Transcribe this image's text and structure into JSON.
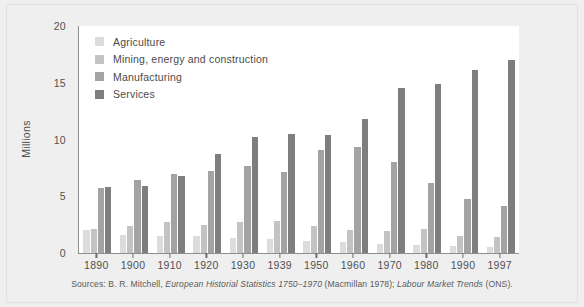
{
  "chart_data": {
    "type": "bar",
    "title": "",
    "subtitle": "",
    "xlabel": "",
    "ylabel": "Millions",
    "ylim": [
      0,
      20
    ],
    "yticks": [
      0,
      5,
      10,
      15,
      20
    ],
    "ytick_labels": [
      "0",
      "5",
      "10",
      "15",
      "20"
    ],
    "grid": false,
    "legend_position": "top-left-inside",
    "categories": [
      "1890",
      "1900",
      "1910",
      "1920",
      "1930",
      "1939",
      "1950",
      "1960",
      "1970",
      "1980",
      "1990",
      "1997"
    ],
    "series": [
      {
        "name": "Agriculture",
        "color": "#dcdcdc",
        "values": [
          2.0,
          1.6,
          1.5,
          1.5,
          1.3,
          1.2,
          1.1,
          1.0,
          0.8,
          0.7,
          0.6,
          0.5
        ]
      },
      {
        "name": "Mining, energy and construction",
        "color": "#c3c3c3",
        "values": [
          2.1,
          2.4,
          2.7,
          2.5,
          2.7,
          2.8,
          2.4,
          2.0,
          1.9,
          2.1,
          1.5,
          1.4
        ]
      },
      {
        "name": "Manufacturing",
        "color": "#a3a3a3",
        "values": [
          5.7,
          6.4,
          7.0,
          7.2,
          7.7,
          7.1,
          9.1,
          9.3,
          8.0,
          6.2,
          4.8,
          4.1
        ]
      },
      {
        "name": "Services",
        "color": "#7e7e7e",
        "values": [
          5.8,
          5.9,
          6.8,
          8.7,
          10.2,
          10.5,
          10.4,
          11.8,
          14.5,
          14.9,
          16.1,
          17.0
        ]
      }
    ],
    "source_prefix": "Sources: B. R. Mitchell,",
    "source_italic_1": "European Historial Statistics 1750–1970",
    "source_mid": "(Macmillan 1978);",
    "source_italic_2": "Labour Market Trends",
    "source_suffix": "(ONS)."
  },
  "colors": {
    "background": "#efefef",
    "plot_background": "#ffffff",
    "axis": "#8e8e8e",
    "text": "#4f4f4f"
  }
}
